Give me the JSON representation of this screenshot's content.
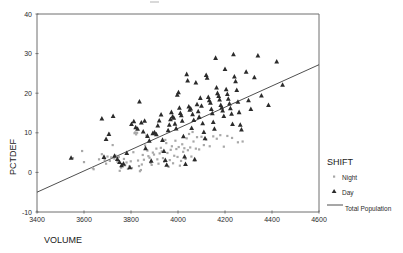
{
  "chart_data": {
    "type": "scatter",
    "title": "",
    "xlabel": "VOLUME",
    "ylabel": "PCTDEF",
    "xlim": [
      3400,
      4600
    ],
    "ylim": [
      -10,
      40
    ],
    "xticks": [
      3400,
      3600,
      3800,
      4000,
      4200,
      4400,
      4600
    ],
    "yticks": [
      -10,
      0,
      10,
      20,
      30,
      40
    ],
    "grid": false,
    "legend_position": "right",
    "legend_title": "SHIFT",
    "series": [
      {
        "name": "Night",
        "marker": "small-dot",
        "color": "#a8a8a8",
        "points": [
          [
            3553,
            3.6
          ],
          [
            3592,
            5.4
          ],
          [
            3600,
            2.6
          ],
          [
            3637,
            1.1
          ],
          [
            3641,
            0.8
          ],
          [
            3664,
            3.3
          ],
          [
            3676,
            4.6
          ],
          [
            3688,
            3.1
          ],
          [
            3694,
            2.2
          ],
          [
            3700,
            4.0
          ],
          [
            3707,
            9.8
          ],
          [
            3710,
            2.9
          ],
          [
            3716,
            3.8
          ],
          [
            3722,
            6.9
          ],
          [
            3729,
            3.5
          ],
          [
            3735,
            4.2
          ],
          [
            3742,
            2.7
          ],
          [
            3748,
            3.9
          ],
          [
            3752,
            0.4
          ],
          [
            3758,
            1.2
          ],
          [
            3764,
            2.1
          ],
          [
            3770,
            3.4
          ],
          [
            3775,
            1.8
          ],
          [
            3781,
            2.5
          ],
          [
            3787,
            0.9
          ],
          [
            3793,
            1.5
          ],
          [
            3799,
            2.8
          ],
          [
            3804,
            1.1
          ],
          [
            3810,
            5.1
          ],
          [
            3815,
            9.9
          ],
          [
            3818,
            10.1
          ],
          [
            3822,
            9.6
          ],
          [
            3826,
            10.0
          ],
          [
            3830,
            3.0
          ],
          [
            3834,
            1.6
          ],
          [
            3838,
            0.3
          ],
          [
            3842,
            0.6
          ],
          [
            3846,
            2.0
          ],
          [
            3850,
            4.4
          ],
          [
            3855,
            3.2
          ],
          [
            3860,
            6.8
          ],
          [
            3865,
            9.3
          ],
          [
            3870,
            5.5
          ],
          [
            3874,
            4.1
          ],
          [
            3879,
            3.7
          ],
          [
            3884,
            2.4
          ],
          [
            3888,
            1.9
          ],
          [
            3893,
            5.0
          ],
          [
            3898,
            4.5
          ],
          [
            3903,
            9.9
          ],
          [
            3908,
            6.0
          ],
          [
            3912,
            3.3
          ],
          [
            3917,
            2.2
          ],
          [
            3922,
            4.8
          ],
          [
            3927,
            6.2
          ],
          [
            3931,
            5.3
          ],
          [
            3936,
            3.6
          ],
          [
            3941,
            2.7
          ],
          [
            3946,
            8.2
          ],
          [
            3950,
            7.4
          ],
          [
            3955,
            4.9
          ],
          [
            3960,
            1.4
          ],
          [
            3965,
            3.1
          ],
          [
            3969,
            5.7
          ],
          [
            3974,
            6.6
          ],
          [
            3979,
            2.3
          ],
          [
            3984,
            4.2
          ],
          [
            3989,
            8.0
          ],
          [
            3993,
            5.9
          ],
          [
            3998,
            3.9
          ],
          [
            4003,
            6.4
          ],
          [
            4008,
            1.7
          ],
          [
            4013,
            2.9
          ],
          [
            4018,
            7.1
          ],
          [
            4022,
            5.2
          ],
          [
            4027,
            6.1
          ],
          [
            4032,
            3.4
          ],
          [
            4037,
            8.6
          ],
          [
            4042,
            5.6
          ],
          [
            4047,
            9.7
          ],
          [
            4052,
            6.3
          ],
          [
            4057,
            4.0
          ],
          [
            4062,
            10.2
          ],
          [
            4066,
            7.8
          ],
          [
            4071,
            3.0
          ],
          [
            4076,
            6.0
          ],
          [
            4081,
            8.9
          ],
          [
            4090,
            5.8
          ],
          [
            4100,
            9.0
          ],
          [
            4110,
            6.9
          ],
          [
            4120,
            8.3
          ],
          [
            4135,
            6.6
          ],
          [
            4150,
            9.1
          ],
          [
            4165,
            8.5
          ],
          [
            4180,
            9.4
          ],
          [
            4195,
            6.5
          ],
          [
            4210,
            9.2
          ],
          [
            4230,
            8.7
          ],
          [
            4255,
            7.6
          ],
          [
            4275,
            7.8
          ]
        ]
      },
      {
        "name": "Day",
        "marker": "triangle",
        "color": "#2b2b2b",
        "points": [
          [
            3545,
            3.7
          ],
          [
            3676,
            13.6
          ],
          [
            3685,
            3.9
          ],
          [
            3694,
            8.4
          ],
          [
            3706,
            9.7
          ],
          [
            3724,
            14.2
          ],
          [
            3730,
            4.2
          ],
          [
            3742,
            3.4
          ],
          [
            3751,
            2.6
          ],
          [
            3760,
            1.8
          ],
          [
            3768,
            2.2
          ],
          [
            3782,
            4.9
          ],
          [
            3795,
            1.3
          ],
          [
            3802,
            12.2
          ],
          [
            3812,
            12.9
          ],
          [
            3820,
            11.4
          ],
          [
            3828,
            11.0
          ],
          [
            3836,
            17.9
          ],
          [
            3844,
            12.6
          ],
          [
            3852,
            10.3
          ],
          [
            3858,
            13.0
          ],
          [
            3862,
            6.1
          ],
          [
            3870,
            9.2
          ],
          [
            3878,
            8.0
          ],
          [
            3886,
            2.9
          ],
          [
            3893,
            9.9
          ],
          [
            3900,
            10.1
          ],
          [
            3908,
            9.6
          ],
          [
            3914,
            11.8
          ],
          [
            3920,
            13.1
          ],
          [
            3928,
            14.6
          ],
          [
            3934,
            8.2
          ],
          [
            3940,
            5.4
          ],
          [
            3946,
            3.1
          ],
          [
            3952,
            1.9
          ],
          [
            3958,
            10.6
          ],
          [
            3963,
            12.0
          ],
          [
            3968,
            13.4
          ],
          [
            3972,
            15.2
          ],
          [
            3977,
            14.1
          ],
          [
            3982,
            13.8
          ],
          [
            3987,
            12.3
          ],
          [
            3992,
            11.1
          ],
          [
            3997,
            19.6
          ],
          [
            4002,
            20.2
          ],
          [
            4006,
            16.3
          ],
          [
            4010,
            15.0
          ],
          [
            4014,
            14.4
          ],
          [
            4018,
            13.0
          ],
          [
            4023,
            9.1
          ],
          [
            4028,
            4.0
          ],
          [
            4032,
            2.1
          ],
          [
            4037,
            24.8
          ],
          [
            4041,
            23.2
          ],
          [
            4046,
            16.6
          ],
          [
            4050,
            15.8
          ],
          [
            4054,
            16.1
          ],
          [
            4058,
            11.2
          ],
          [
            4062,
            14.7
          ],
          [
            4067,
            13.2
          ],
          [
            4071,
            3.3
          ],
          [
            4076,
            22.7
          ],
          [
            4081,
            17.2
          ],
          [
            4086,
            15.4
          ],
          [
            4090,
            14.0
          ],
          [
            4095,
            18.8
          ],
          [
            4100,
            16.8
          ],
          [
            4105,
            12.4
          ],
          [
            4110,
            10.2
          ],
          [
            4115,
            8.6
          ],
          [
            4120,
            24.6
          ],
          [
            4124,
            23.9
          ],
          [
            4129,
            19.0
          ],
          [
            4133,
            18.2
          ],
          [
            4138,
            17.6
          ],
          [
            4142,
            16.0
          ],
          [
            4146,
            14.9
          ],
          [
            4150,
            12.7
          ],
          [
            4155,
            11.0
          ],
          [
            4160,
            28.9
          ],
          [
            4164,
            21.4
          ],
          [
            4168,
            20.0
          ],
          [
            4173,
            19.3
          ],
          [
            4177,
            18.4
          ],
          [
            4182,
            17.0
          ],
          [
            4186,
            16.4
          ],
          [
            4190,
            15.6
          ],
          [
            4195,
            14.2
          ],
          [
            4200,
            26.1
          ],
          [
            4205,
            21.0
          ],
          [
            4210,
            19.8
          ],
          [
            4214,
            18.6
          ],
          [
            4219,
            17.4
          ],
          [
            4223,
            16.2
          ],
          [
            4228,
            14.8
          ],
          [
            4232,
            12.2
          ],
          [
            4236,
            29.8
          ],
          [
            4240,
            24.2
          ],
          [
            4245,
            23.0
          ],
          [
            4250,
            20.8
          ],
          [
            4255,
            17.8
          ],
          [
            4260,
            15.2
          ],
          [
            4265,
            12.0
          ],
          [
            4270,
            10.8
          ],
          [
            4290,
            25.4
          ],
          [
            4300,
            18.2
          ],
          [
            4310,
            16.0
          ],
          [
            4325,
            24.0
          ],
          [
            4340,
            29.5
          ],
          [
            4355,
            19.4
          ],
          [
            4385,
            17.0
          ],
          [
            4420,
            28.0
          ],
          [
            4445,
            22.1
          ]
        ]
      }
    ],
    "fit_line": {
      "label": "Total Population",
      "x0": 3400,
      "y0": -5.0,
      "x1": 4600,
      "y1": 27.2,
      "color": "#3b3b3b"
    }
  },
  "legend": {
    "title": "SHIFT",
    "items": [
      {
        "label": "Night",
        "marker": "small-dot"
      },
      {
        "label": "Day",
        "marker": "triangle"
      },
      {
        "label": "Total Population",
        "marker": "line"
      }
    ]
  },
  "axes": {
    "x_title": "VOLUME",
    "y_title": "PCTDEF"
  }
}
